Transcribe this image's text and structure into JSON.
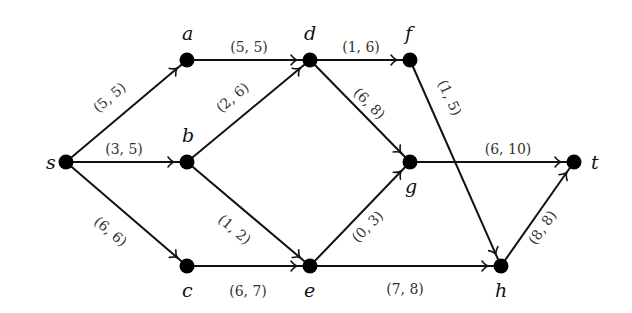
{
  "diagram": {
    "type": "flow-network",
    "nodes": [
      {
        "id": "s",
        "label": "s",
        "x": 66,
        "y": 162,
        "lx": 46,
        "ly": 169
      },
      {
        "id": "a",
        "label": "a",
        "x": 187,
        "y": 60,
        "lx": 182,
        "ly": 40
      },
      {
        "id": "b",
        "label": "b",
        "x": 187,
        "y": 162,
        "lx": 182,
        "ly": 142
      },
      {
        "id": "c",
        "label": "c",
        "x": 187,
        "y": 266,
        "lx": 182,
        "ly": 297
      },
      {
        "id": "d",
        "label": "d",
        "x": 310,
        "y": 60,
        "lx": 304,
        "ly": 40
      },
      {
        "id": "e",
        "label": "e",
        "x": 310,
        "y": 266,
        "lx": 304,
        "ly": 297
      },
      {
        "id": "f",
        "label": "f",
        "x": 410,
        "y": 60,
        "lx": 405,
        "ly": 40
      },
      {
        "id": "g",
        "label": "g",
        "x": 410,
        "y": 162,
        "lx": 405,
        "ly": 193
      },
      {
        "id": "h",
        "label": "h",
        "x": 501,
        "y": 266,
        "lx": 495,
        "ly": 297
      },
      {
        "id": "t",
        "label": "t",
        "x": 574,
        "y": 162,
        "lx": 591,
        "ly": 169
      }
    ],
    "edges": [
      {
        "from": "s",
        "to": "a",
        "flow": 5,
        "capacity": 5,
        "label": "(5, 5)",
        "lx": 110,
        "ly": 98,
        "rot": -40
      },
      {
        "from": "s",
        "to": "b",
        "flow": 3,
        "capacity": 5,
        "label": "(3, 5)",
        "lx": 124,
        "ly": 150,
        "rot": 0
      },
      {
        "from": "s",
        "to": "c",
        "flow": 6,
        "capacity": 6,
        "label": "(6, 6)",
        "lx": 110,
        "ly": 232,
        "rot": 40
      },
      {
        "from": "a",
        "to": "d",
        "flow": 5,
        "capacity": 5,
        "label": "(5, 5)",
        "lx": 249,
        "ly": 48,
        "rot": 0
      },
      {
        "from": "b",
        "to": "d",
        "flow": 2,
        "capacity": 6,
        "label": "(2, 6)",
        "lx": 233,
        "ly": 98,
        "rot": -40
      },
      {
        "from": "b",
        "to": "e",
        "flow": 1,
        "capacity": 2,
        "label": "(1, 2)",
        "lx": 234,
        "ly": 230,
        "rot": 40
      },
      {
        "from": "c",
        "to": "e",
        "flow": 6,
        "capacity": 7,
        "label": "(6, 7)",
        "lx": 248,
        "ly": 292,
        "rot": 0
      },
      {
        "from": "d",
        "to": "f",
        "flow": 1,
        "capacity": 6,
        "label": "(1, 6)",
        "lx": 361,
        "ly": 48,
        "rot": 0
      },
      {
        "from": "d",
        "to": "g",
        "flow": 6,
        "capacity": 8,
        "label": "(6, 8)",
        "lx": 369,
        "ly": 104,
        "rot": 45
      },
      {
        "from": "f",
        "to": "h",
        "flow": 1,
        "capacity": 5,
        "label": "(1, 5)",
        "lx": 449,
        "ly": 98,
        "rot": 65
      },
      {
        "from": "g",
        "to": "t",
        "flow": 6,
        "capacity": 10,
        "label": "(6, 10)",
        "lx": 508,
        "ly": 150,
        "rot": 0
      },
      {
        "from": "e",
        "to": "g",
        "flow": 0,
        "capacity": 3,
        "label": "(0, 3)",
        "lx": 368,
        "ly": 227,
        "rot": -45
      },
      {
        "from": "e",
        "to": "h",
        "flow": 7,
        "capacity": 8,
        "label": "(7, 8)",
        "lx": 405,
        "ly": 290,
        "rot": 0
      },
      {
        "from": "h",
        "to": "t",
        "flow": 8,
        "capacity": 8,
        "label": "(8, 8)",
        "lx": 543,
        "ly": 228,
        "rot": -55
      }
    ],
    "colors": {
      "node": "#000000",
      "edge": "#111111",
      "label": "#333333",
      "background": "#ffffff"
    }
  }
}
